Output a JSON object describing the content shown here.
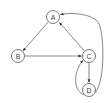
{
  "diagram": {
    "type": "directed-graph",
    "nodes": [
      {
        "id": "A",
        "label": "A",
        "x": 53,
        "y": 17
      },
      {
        "id": "B",
        "label": "B",
        "x": 18,
        "y": 56
      },
      {
        "id": "C",
        "label": "C",
        "x": 89,
        "y": 56
      },
      {
        "id": "D",
        "label": "D",
        "x": 89,
        "y": 90
      }
    ],
    "edges": [
      {
        "from": "A",
        "to": "B",
        "style": "straight"
      },
      {
        "from": "B",
        "to": "C",
        "style": "straight"
      },
      {
        "from": "C",
        "to": "A",
        "style": "straight"
      },
      {
        "from": "C",
        "to": "D",
        "style": "straight"
      },
      {
        "from": "D",
        "to": "C",
        "style": "curved-left"
      },
      {
        "from": "D",
        "to": "A",
        "style": "curved-right"
      }
    ],
    "colors": {
      "stroke": "#555555",
      "node_fill": "#ffffff",
      "label": "#444444"
    }
  }
}
